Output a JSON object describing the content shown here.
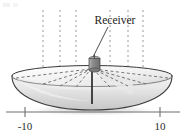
{
  "figure": {
    "type": "satellite-dish-parabola-diagram",
    "background_color": "#ffffff",
    "callout": {
      "label": "Receiver",
      "label_x": 115,
      "label_y": 22,
      "leader_from": [
        108,
        27
      ],
      "leader_to": [
        92,
        58
      ]
    },
    "axis": {
      "line_color": "#6f6f6f",
      "y": 112,
      "x_start": 6,
      "x_end": 180,
      "ticks": [
        {
          "label": "-10",
          "value": -10,
          "x": 25,
          "label_x": 25,
          "label_y": 128
        },
        {
          "label": "10",
          "value": 10,
          "x": 160,
          "label_x": 160,
          "label_y": 128
        }
      ]
    },
    "dish": {
      "rim_center_x": 92,
      "rim_center_y": 76,
      "rim_radius_x": 80,
      "rim_radius_y": 11,
      "bowl_depth_y": 109,
      "outline_color": "#3a3a3a",
      "fill_top": "#f3f3f3",
      "fill_bottom": "#cfcfcf"
    },
    "receiver": {
      "x": 89,
      "y": 58,
      "width": 11,
      "height": 14,
      "color": "#8d8d8d",
      "post_color": "#1f1f1f",
      "post_top_y": 72,
      "post_bottom_y": 104
    },
    "incoming_rays": {
      "count": 6,
      "color": "#9a9a9a",
      "dash": "2 3",
      "top_y": 10,
      "x_positions": [
        43,
        60,
        76,
        110,
        128,
        143
      ]
    },
    "reflected_rays": {
      "color": "#6a6a6a",
      "dash": "3 2.5",
      "focus": [
        92,
        68
      ],
      "rim_points": [
        [
          16,
          78
        ],
        [
          43,
          84
        ],
        [
          60,
          86
        ],
        [
          76,
          87
        ],
        [
          110,
          87
        ],
        [
          128,
          86
        ],
        [
          146,
          84
        ],
        [
          168,
          78
        ]
      ]
    },
    "accent_colors": {
      "ink": "#2b2b2b",
      "dish_edge": "#3a3a3a",
      "ray": "#9a9a9a",
      "axis": "#6f6f6f"
    }
  }
}
